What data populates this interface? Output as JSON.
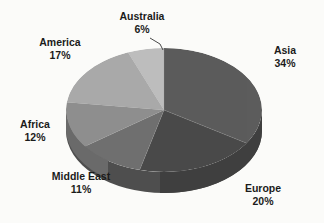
{
  "background_color": "#fbfbf9",
  "chart_data": {
    "type": "pie",
    "title": "",
    "three_d": true,
    "legend": "none",
    "labels_position": "outside",
    "categories": [
      "Asia",
      "Europe",
      "Middle East",
      "Africa",
      "America",
      "Australia"
    ],
    "values": [
      34,
      20,
      11,
      12,
      17,
      6
    ],
    "unit": "%",
    "colors": [
      "#5c5c5c",
      "#4a4a4a",
      "#6f6f6f",
      "#8e8e8e",
      "#a9a9a9",
      "#bdbdbd"
    ],
    "side_colors": [
      "#4b4b4b",
      "#3d3d3d",
      "#5b5b5b",
      "#747474",
      "#8b8b8b",
      "#9a9a9a"
    ],
    "slices": [
      {
        "label": "Asia",
        "value": 34,
        "percent_text": "34%",
        "color": "#5c5c5c"
      },
      {
        "label": "Europe",
        "value": 20,
        "percent_text": "20%",
        "color": "#4a4a4a"
      },
      {
        "label": "Middle East",
        "value": 11,
        "percent_text": "11%",
        "color": "#6f6f6f"
      },
      {
        "label": "Africa",
        "value": 12,
        "percent_text": "12%",
        "color": "#8e8e8e"
      },
      {
        "label": "America",
        "value": 17,
        "percent_text": "17%",
        "color": "#a9a9a9"
      },
      {
        "label": "Australia",
        "value": 6,
        "percent_text": "6%",
        "color": "#bdbdbd"
      }
    ]
  },
  "labels": {
    "asia": {
      "name": "Asia",
      "pct": "34%"
    },
    "europe": {
      "name": "Europe",
      "pct": "20%"
    },
    "middle_east": {
      "name": "Middle East",
      "pct": "11%"
    },
    "africa": {
      "name": "Africa",
      "pct": "12%"
    },
    "america": {
      "name": "America",
      "pct": "17%"
    },
    "australia": {
      "name": "Australia",
      "pct": "6%"
    }
  },
  "artifacts": {
    "bleed1": "",
    "bleed2": "",
    "bleed3": "",
    "bleed4": ""
  }
}
